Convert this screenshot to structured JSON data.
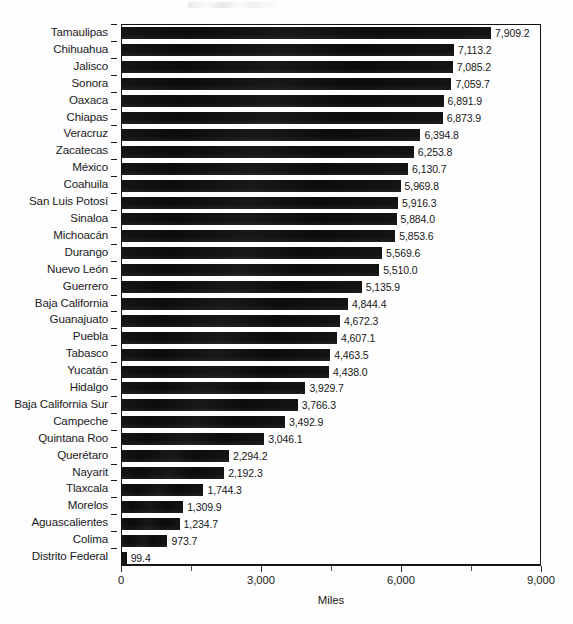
{
  "chart_data": {
    "type": "bar",
    "orientation": "horizontal",
    "title": "",
    "xlabel": "Miles",
    "ylabel": "",
    "xlim": [
      0,
      9000
    ],
    "xticks": [
      0,
      3000,
      6000,
      9000
    ],
    "xtick_labels": [
      "0",
      "3,000",
      "6,000",
      "9,000"
    ],
    "minor_ticks": [
      1500,
      4500,
      7500
    ],
    "grid": false,
    "legend": null,
    "bar_color": "#0c0c0c",
    "categories": [
      "Tamaulipas",
      "Chihuahua",
      "Jalisco",
      "Sonora",
      "Oaxaca",
      "Chiapas",
      "Veracruz",
      "Zacatecas",
      "México",
      "Coahuila",
      "San Luis Potosí",
      "Sinaloa",
      "Michoacán",
      "Durango",
      "Nuevo León",
      "Guerrero",
      "Baja California",
      "Guanajuato",
      "Puebla",
      "Tabasco",
      "Yucatán",
      "Hidalgo",
      "Baja California Sur",
      "Campeche",
      "Quintana Roo",
      "Querétaro",
      "Nayarit",
      "Tlaxcala",
      "Morelos",
      "Aguascalientes",
      "Colima",
      "Distrito Federal"
    ],
    "values": [
      7909.2,
      7113.2,
      7085.2,
      7059.7,
      6891.9,
      6873.9,
      6394.8,
      6253.8,
      6130.7,
      5969.8,
      5916.3,
      5884.0,
      5853.6,
      5569.6,
      5510.0,
      5135.9,
      4844.4,
      4672.3,
      4607.1,
      4463.5,
      4438.0,
      3929.7,
      3766.3,
      3492.9,
      3046.1,
      2294.2,
      2192.3,
      1744.3,
      1309.9,
      1234.7,
      973.7,
      99.4
    ],
    "value_labels": [
      "7,909.2",
      "7,113.2",
      "7,085.2",
      "7,059.7",
      "6,891.9",
      "6,873.9",
      "6,394.8",
      "6,253.8",
      "6,130.7",
      "5,969.8",
      "5,916.3",
      "5,884.0",
      "5,853.6",
      "5,569.6",
      "5,510.0",
      "5,135.9",
      "4,844.4",
      "4,672.3",
      "4,607.1",
      "4,463.5",
      "4,438.0",
      "3,929.7",
      "3,766.3",
      "3,492.9",
      "3,046.1",
      "2,294.2",
      "2,192.3",
      "1,744.3",
      "1,309.9",
      "1,234.7",
      "973.7",
      "99.4"
    ]
  }
}
